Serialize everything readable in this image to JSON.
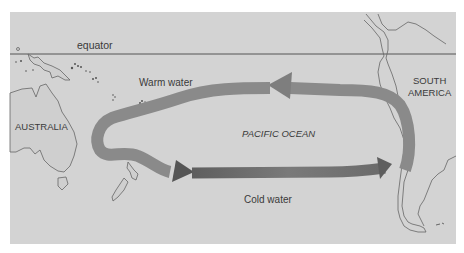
{
  "map": {
    "title": "",
    "background_color": "#d3d3d3",
    "arrow_color_warm": "#8a8a8a",
    "arrow_color_cold": "#6e6e6e",
    "labels": {
      "equator": "equator",
      "warm_water": "Warm water",
      "cold_water": "Cold water",
      "pacific_ocean": "PACIFIC OCEAN",
      "australia": "AUSTRALIA",
      "south_america_line1": "SOUTH",
      "south_america_line2": "AMERICA"
    },
    "features": [
      "equator-line",
      "australia-landmass",
      "new-guinea",
      "new-zealand",
      "tasmania",
      "pacific-islands",
      "south-america-landmass",
      "circulation-loop-arrows"
    ]
  }
}
